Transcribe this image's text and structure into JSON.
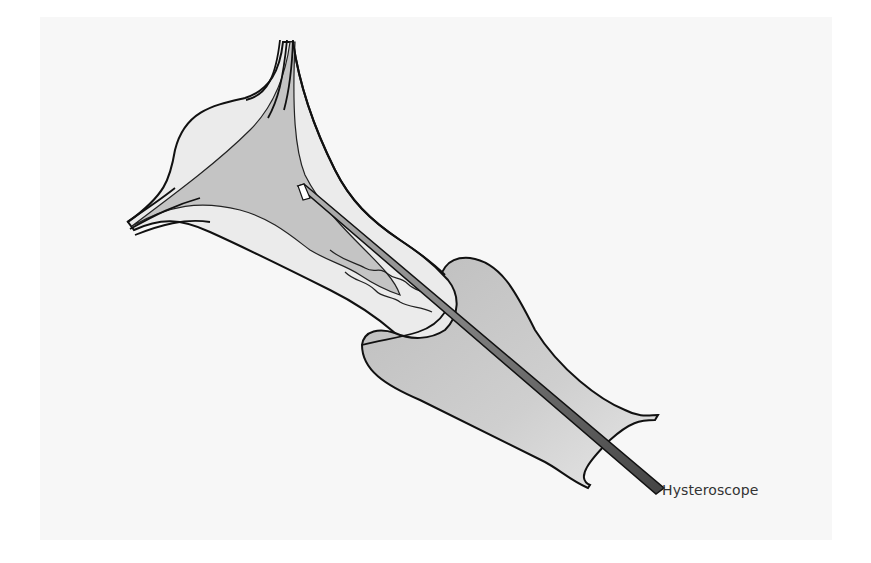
{
  "figure": {
    "labels": [
      {
        "id": "hysteroscope",
        "text": "Hysteroscope"
      }
    ]
  },
  "colors": {
    "page_background": "#ffffff",
    "panel_background": "#f7f7f7",
    "tissue_light": "#e9e9e9",
    "cavity_fill": "#c4c4c4",
    "vagina_fill": "#c6c6c6",
    "outline": "#111111",
    "scope_dark": "#4a4a4a",
    "scope_light": "#9a9a9a",
    "label_text": "#333333"
  }
}
